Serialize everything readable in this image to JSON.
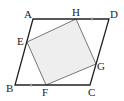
{
  "diagram": {
    "type": "geometry",
    "colors": {
      "stroke": "#222222",
      "inner_stroke": "#555555",
      "fill": "#eeeeee",
      "tick": "#cccccc"
    },
    "outer": {
      "name": "ABCD",
      "points": {
        "A": [
          33,
          19
        ],
        "D": [
          109,
          19
        ],
        "C": [
          90,
          85
        ],
        "B": [
          15,
          85
        ]
      }
    },
    "inner": {
      "name": "EFGH",
      "points": {
        "H": [
          76,
          19
        ],
        "G": [
          96,
          64
        ],
        "F": [
          46,
          85
        ],
        "E": [
          27,
          42
        ]
      }
    },
    "labels": {
      "A": "A",
      "B": "B",
      "C": "C",
      "D": "D",
      "E": "E",
      "F": "F",
      "G": "G",
      "H": "H"
    }
  }
}
